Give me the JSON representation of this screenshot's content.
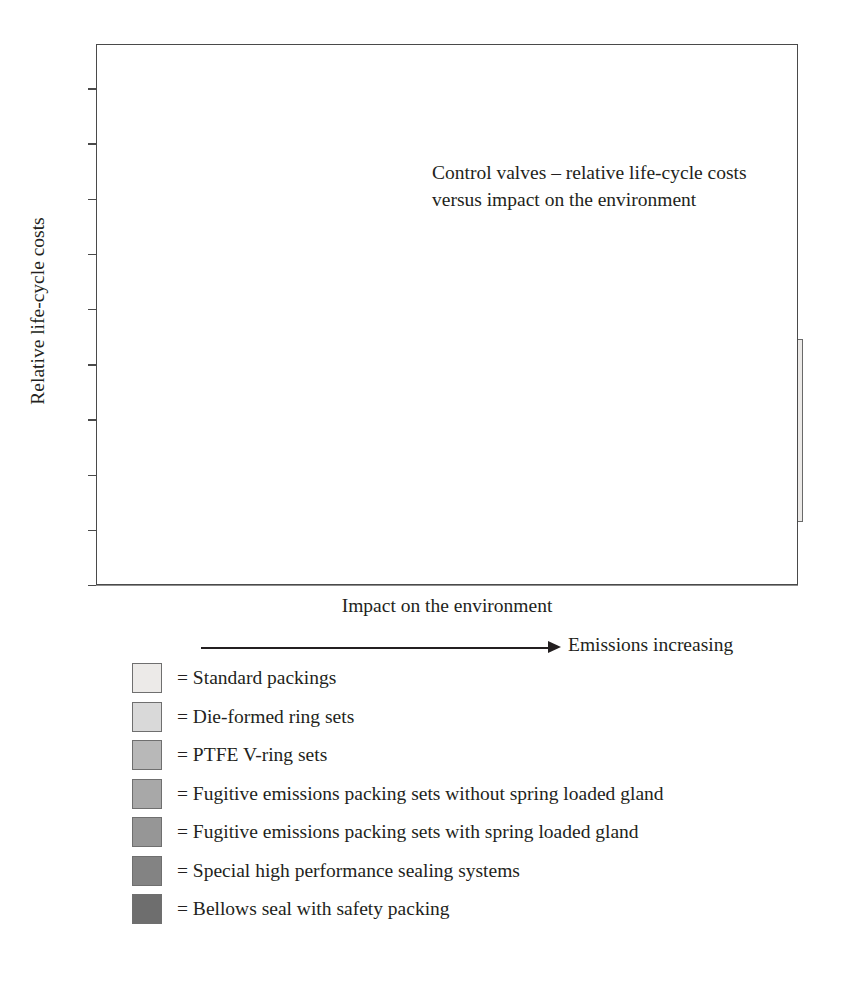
{
  "chart_data": {
    "type": "bar",
    "title": "Control valves – relative life-cycle costs versus impact on the environment",
    "title_lines": [
      "Control valves – relative life-cycle costs",
      "versus impact on the environment"
    ],
    "xlabel": "Impact on the environment",
    "ylabel": "Relative life-cycle costs",
    "x_annotation": "Emissions increasing",
    "ylim": [
      0,
      9.8
    ],
    "xlim": [
      0,
      14
    ],
    "y_ticks": [
      0,
      1,
      2,
      3,
      4,
      5,
      6,
      7,
      8,
      9
    ],
    "y_tick_labels": [
      "0",
      "1",
      "2",
      "3",
      "4",
      "5",
      "6",
      "7",
      "8",
      "9"
    ],
    "grid": {
      "major_y_step": 1,
      "minor_y_step": 0.5,
      "major_x_step": 1,
      "vertical_columns": 14
    },
    "legend_position": "below-plot",
    "series": [
      {
        "name": "Standard packings",
        "color": "#eceae8",
        "x0": 11.0,
        "x1": 14.1,
        "y0": 1.15,
        "y1": 4.45
      },
      {
        "name": "Die-formed ring sets",
        "color": "#d9d9d9",
        "x0": 9.95,
        "x1": 13.0,
        "y0": 0.42,
        "y1": 3.0
      },
      {
        "name": "PTFE V-ring sets",
        "color": "#b8b8b8",
        "x0": 6.3,
        "x1": 13.0,
        "y0": 0.42,
        "y1": 1.82
      },
      {
        "name": "Fugitive emissions packing sets without spring loaded gland",
        "color": "#a8a8a8",
        "x0": 4.0,
        "x1": 8.75,
        "y0": 0.48,
        "y1": 3.3
      },
      {
        "name": "Fugitive emissions packing sets with spring loaded gland",
        "color": "#969696",
        "x0": 3.35,
        "x1": 7.3,
        "y0": 0.48,
        "y1": 3.5
      },
      {
        "name": "Special high performance sealing systems",
        "color": "#838383",
        "x0": 2.85,
        "x1": 6.6,
        "y0": 0.7,
        "y1": 4.0
      },
      {
        "name": "Bellows seal with safety packing",
        "color": "#6e6e6e",
        "x0": 0.0,
        "x1": 3.0,
        "y0": 3.0,
        "y1": 9.2
      }
    ]
  },
  "legend": {
    "equals_sign": "=",
    "items": [
      {
        "label": "Standard packings",
        "color": "#eceae8"
      },
      {
        "label": "Die-formed ring sets",
        "color": "#d9d9d9"
      },
      {
        "label": "PTFE V-ring sets",
        "color": "#b8b8b8"
      },
      {
        "label": "Fugitive emissions packing sets without spring loaded gland",
        "color": "#a8a8a8"
      },
      {
        "label": "Fugitive emissions packing sets with spring loaded gland",
        "color": "#969696"
      },
      {
        "label": "Special high performance sealing systems",
        "color": "#838383"
      },
      {
        "label": "Bellows seal with safety packing",
        "color": "#6e6e6e"
      }
    ]
  }
}
